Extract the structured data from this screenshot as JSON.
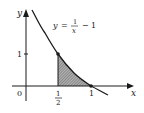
{
  "figure": {
    "type": "area-under-curve diagram",
    "equation": {
      "lhs": "y",
      "equals": "=",
      "numerator": "1",
      "denominator": "x",
      "minus": "−",
      "constant": "1"
    },
    "axes": {
      "x_label": "x",
      "y_label": "y",
      "origin_label": "0",
      "x_ticks": [
        {
          "numerator": "1",
          "denominator": "2",
          "value": 0.5
        },
        {
          "label": "1",
          "value": 1
        }
      ],
      "y_ticks": [
        {
          "label": "1",
          "value": 1
        }
      ]
    },
    "points": [
      {
        "x": 0.5,
        "y": 1
      },
      {
        "x": 1,
        "y": 0
      }
    ],
    "shaded_region": {
      "description": "region under y = 1/x − 1 from x = 1/2 to x = 1",
      "x_from": 0.5,
      "x_to": 1
    },
    "colors": {
      "stroke": "#1a1a1a",
      "shade": "#8a8a8a",
      "background": "#ffffff"
    }
  }
}
